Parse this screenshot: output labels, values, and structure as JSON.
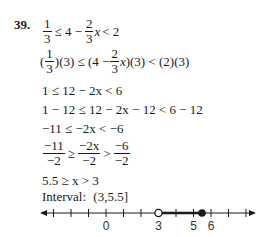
{
  "problem": {
    "number": "39.",
    "steps": [
      {
        "id": "s1",
        "parts": [
          {
            "frac": [
              "1",
              "3"
            ]
          },
          {
            "t": "≤ 4 −"
          },
          {
            "frac": [
              "2",
              "3"
            ]
          },
          {
            "t": "x",
            "italic": true
          },
          {
            "t": "< 2"
          }
        ]
      },
      {
        "id": "s2",
        "parts": [
          {
            "t": "("
          },
          {
            "frac": [
              "1",
              "3"
            ]
          },
          {
            "t": ")(3) ≤ (4 −"
          },
          {
            "frac": [
              "2",
              "3"
            ]
          },
          {
            "t": "x",
            "italic": true
          },
          {
            "t": ")(3) < (2)(3)"
          }
        ]
      },
      {
        "id": "s3",
        "text": "1 ≤ 12 − 2x < 6"
      },
      {
        "id": "s4",
        "text": "1 − 12 ≤ 12 − 2x − 12 < 6 − 12"
      },
      {
        "id": "s5",
        "text": "−11 ≤ −2x < −6"
      },
      {
        "id": "s6",
        "parts": [
          {
            "frac": [
              "−11",
              "−2"
            ]
          },
          {
            "t": "≥"
          },
          {
            "frac": [
              "−2x",
              "−2"
            ]
          },
          {
            "t": ">"
          },
          {
            "frac": [
              "−6",
              "−2"
            ]
          }
        ]
      },
      {
        "id": "s7",
        "text": "5.5 ≥ x > 3"
      }
    ],
    "interval_label": "Interval:",
    "interval_value": "(3,5.5]"
  },
  "number_line": {
    "min": -3,
    "max": 8,
    "ticks": [
      -3,
      -2,
      -1,
      0,
      1,
      2,
      3,
      4,
      5,
      6,
      7,
      8
    ],
    "labels": [
      {
        "value": 0,
        "text": "0"
      },
      {
        "value": 3,
        "text": "3"
      },
      {
        "value": 5,
        "text": "5"
      },
      {
        "value": 6,
        "text": "6"
      }
    ],
    "open_endpoint": 3,
    "closed_endpoint": 5.5,
    "color": "#1a1a1a"
  }
}
